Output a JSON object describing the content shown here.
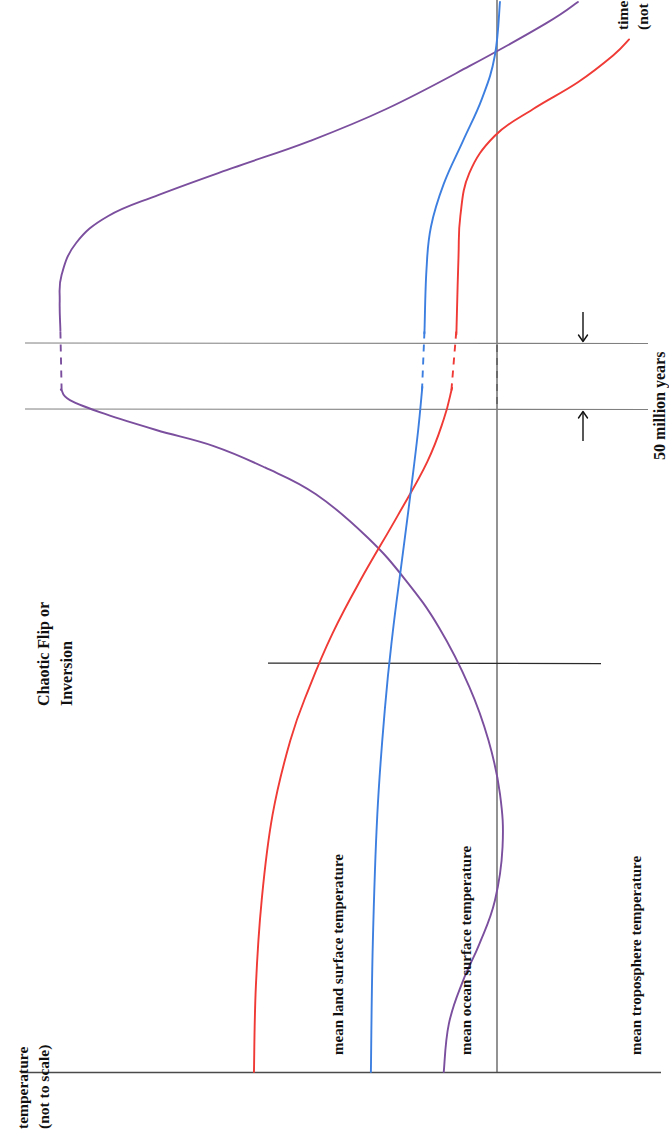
{
  "figure": {
    "kind": "schematic line chart, rotated 90 degrees (sideways page)",
    "background_color": "#ffffff"
  },
  "axes": {
    "time_axis_label": "time",
    "time_axis_sublabel": "(not to scale)",
    "temperature_axis_label": "temperature",
    "temperature_axis_sublabel": "(not to scale)"
  },
  "annotations": {
    "event_line_1": "Chaotic Flip or",
    "event_line_2": "Inversion",
    "break_span_label": "50 million years",
    "break_arrow_upper": "down-arrow",
    "break_arrow_lower": "up-arrow"
  },
  "series": [
    {
      "name": "mean land surface temperature",
      "color": "#ef3a35",
      "id": "land"
    },
    {
      "name": "mean ocean surface temperature",
      "color": "#3d7fe0",
      "id": "ocean"
    },
    {
      "name": "mean troposphere temperature",
      "color": "#7b4f9e",
      "id": "troposphere"
    }
  ],
  "chart_data": {
    "type": "line",
    "title": "",
    "xlabel": "temperature (not to scale)",
    "ylabel": "time (not to scale)",
    "orientation": "rotated-90",
    "grid": false,
    "legend": "inline curve labels",
    "axis_notes": "Both axes are schematic and unlabelled numerically; 'not to scale'.",
    "break": {
      "label": "50 million years",
      "description": "Axis break between two horizontal rules; all three curves are drawn dashed across the gap.",
      "upper_rule_time_pos": 0.695,
      "lower_rule_time_pos": 0.637
    },
    "event_marker": {
      "label": "Chaotic Flip or Inversion",
      "description": "Short horizontal marker line crossing all three curves.",
      "time_pos": 0.415
    },
    "series": [
      {
        "name": "mean land surface temperature",
        "color": "#ef3a35",
        "points": [
          {
            "time": 0.0,
            "temp": 0.363
          },
          {
            "time": 0.08,
            "temp": 0.366
          },
          {
            "time": 0.16,
            "temp": 0.375
          },
          {
            "time": 0.24,
            "temp": 0.392
          },
          {
            "time": 0.31,
            "temp": 0.42
          },
          {
            "time": 0.36,
            "temp": 0.45
          },
          {
            "time": 0.41,
            "temp": 0.486
          },
          {
            "time": 0.46,
            "temp": 0.53
          },
          {
            "time": 0.52,
            "temp": 0.588
          },
          {
            "time": 0.57,
            "temp": 0.634
          },
          {
            "time": 0.61,
            "temp": 0.66
          },
          {
            "time": 0.637,
            "temp": 0.672
          },
          {
            "time": 0.695,
            "temp": 0.68
          },
          {
            "time": 0.76,
            "temp": 0.683
          },
          {
            "time": 0.8,
            "temp": 0.686
          },
          {
            "time": 0.84,
            "temp": 0.7
          },
          {
            "time": 0.875,
            "temp": 0.74
          },
          {
            "time": 0.9,
            "temp": 0.8
          },
          {
            "time": 0.925,
            "temp": 0.87
          },
          {
            "time": 0.95,
            "temp": 0.925
          },
          {
            "time": 0.965,
            "temp": 0.95
          }
        ]
      },
      {
        "name": "mean ocean surface temperature",
        "color": "#3d7fe0",
        "points": [
          {
            "time": 0.0,
            "temp": 0.546
          },
          {
            "time": 0.12,
            "temp": 0.549
          },
          {
            "time": 0.24,
            "temp": 0.556
          },
          {
            "time": 0.34,
            "temp": 0.568
          },
          {
            "time": 0.41,
            "temp": 0.58
          },
          {
            "time": 0.48,
            "temp": 0.595
          },
          {
            "time": 0.55,
            "temp": 0.61
          },
          {
            "time": 0.6,
            "temp": 0.62
          },
          {
            "time": 0.637,
            "temp": 0.626
          },
          {
            "time": 0.695,
            "temp": 0.63
          },
          {
            "time": 0.75,
            "temp": 0.633
          },
          {
            "time": 0.79,
            "temp": 0.64
          },
          {
            "time": 0.83,
            "temp": 0.66
          },
          {
            "time": 0.87,
            "temp": 0.69
          },
          {
            "time": 0.91,
            "temp": 0.72
          },
          {
            "time": 0.95,
            "temp": 0.74
          },
          {
            "time": 1.0,
            "temp": 0.748
          }
        ]
      },
      {
        "name": "mean troposphere temperature",
        "color": "#7b4f9e",
        "points": [
          {
            "time": 0.0,
            "temp": 0.66
          },
          {
            "time": 0.045,
            "temp": 0.668
          },
          {
            "time": 0.085,
            "temp": 0.69
          },
          {
            "time": 0.12,
            "temp": 0.716
          },
          {
            "time": 0.16,
            "temp": 0.74
          },
          {
            "time": 0.21,
            "temp": 0.752
          },
          {
            "time": 0.26,
            "temp": 0.748
          },
          {
            "time": 0.31,
            "temp": 0.73
          },
          {
            "time": 0.36,
            "temp": 0.7
          },
          {
            "time": 0.415,
            "temp": 0.653
          },
          {
            "time": 0.46,
            "temp": 0.6
          },
          {
            "time": 0.5,
            "temp": 0.54
          },
          {
            "time": 0.54,
            "temp": 0.46
          },
          {
            "time": 0.565,
            "temp": 0.38
          },
          {
            "time": 0.585,
            "temp": 0.3
          },
          {
            "time": 0.6,
            "temp": 0.21
          },
          {
            "time": 0.615,
            "temp": 0.13
          },
          {
            "time": 0.628,
            "temp": 0.075
          },
          {
            "time": 0.637,
            "temp": 0.062
          },
          {
            "time": 0.695,
            "temp": 0.06
          },
          {
            "time": 0.72,
            "temp": 0.059
          },
          {
            "time": 0.745,
            "temp": 0.062
          },
          {
            "time": 0.775,
            "temp": 0.085
          },
          {
            "time": 0.8,
            "temp": 0.135
          },
          {
            "time": 0.82,
            "temp": 0.215
          },
          {
            "time": 0.845,
            "temp": 0.33
          },
          {
            "time": 0.87,
            "temp": 0.45
          },
          {
            "time": 0.9,
            "temp": 0.57
          },
          {
            "time": 0.94,
            "temp": 0.7
          },
          {
            "time": 0.98,
            "temp": 0.82
          },
          {
            "time": 1.0,
            "temp": 0.87
          }
        ]
      }
    ]
  }
}
